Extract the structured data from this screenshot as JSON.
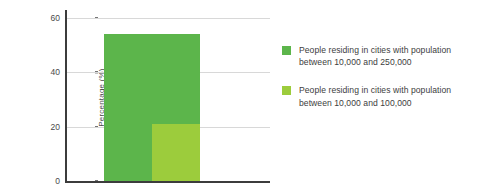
{
  "chart_data": {
    "type": "bar",
    "title": "",
    "xlabel": "",
    "ylabel": "Percentage (%)",
    "ylim": [
      0,
      60
    ],
    "yticks": [
      "0",
      "20",
      "40",
      "60"
    ],
    "ytick_values": [
      0,
      20,
      40,
      60
    ],
    "grid": true,
    "grid_axis": "y",
    "legend_position": "right",
    "categories": [
      ""
    ],
    "series": [
      {
        "name": "People residing in cities with population between 10,000 and 250,000",
        "values": [
          54
        ],
        "color": "#5cb54b"
      },
      {
        "name": "People residing in cities with population between 10,000 and 100,000",
        "values": [
          21
        ],
        "color": "#9ccc3c"
      }
    ],
    "overlap": "overlaid-narrow-front"
  },
  "axis": {
    "y_title": "Percentage (%)",
    "ticks": [
      {
        "label": "60",
        "value": 60
      },
      {
        "label": "40",
        "value": 40
      },
      {
        "label": "20",
        "value": 20
      },
      {
        "label": "0",
        "value": 0
      }
    ]
  },
  "legend": {
    "items": [
      {
        "color": "#5cb54b",
        "label": "People residing in cities with population\nbetween 10,000 and 250,000"
      },
      {
        "color": "#9ccc3c",
        "label": "People residing in cities with population\nbetween 10,000 and 100,000"
      }
    ]
  },
  "colors": {
    "series_dark_green": "#5cb54b",
    "series_light_green": "#9ccc3c",
    "axis": "#3c3c3c",
    "gridline": "#d8d8d8",
    "text": "#4a4a4a",
    "background": "#ffffff"
  }
}
